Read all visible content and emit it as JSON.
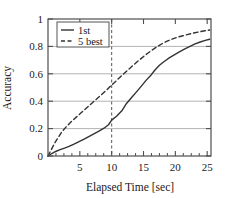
{
  "chart_data": {
    "type": "line",
    "title": "",
    "xlabel": "Elapsed Time [sec]",
    "ylabel": "Accuracy",
    "xlim": [
      0,
      25.6
    ],
    "ylim": [
      0,
      1
    ],
    "xticks": [
      5,
      10,
      15,
      20,
      25
    ],
    "xtick_labels": [
      "5",
      "10",
      "15",
      "20",
      "25"
    ],
    "yticks": [
      0,
      0.2,
      0.4,
      0.6,
      0.8,
      1
    ],
    "ytick_labels": [
      "0",
      "0.2",
      "0.4",
      "0.6",
      "0.8",
      "1"
    ],
    "x_minor_tick_step": 1.25,
    "grid": "horizontal",
    "grid_color": "#b3b3b3",
    "frame_color": "#4d4d4d",
    "legend_position": "top-left",
    "annotations": [
      {
        "name": "vertical-reference-line",
        "type": "vline",
        "x": 10,
        "style": "dashed",
        "color": "#555555"
      }
    ],
    "series": [
      {
        "name": "1st",
        "style": "solid",
        "color": "#333333",
        "x": [
          0,
          0.6,
          1.2,
          1.9,
          2.6,
          3.3,
          4.0,
          4.8,
          5.6,
          6.4,
          7.2,
          8.0,
          8.8,
          9.5,
          10.0,
          10.8,
          11.6,
          12.3,
          13.1,
          13.9,
          14.7,
          15.4,
          16.2,
          16.8,
          17.5,
          18.3,
          19.1,
          19.9,
          20.7,
          21.5,
          22.3,
          23.1,
          23.9,
          24.7,
          25.4
        ],
        "y": [
          0.0,
          0.018,
          0.033,
          0.046,
          0.058,
          0.07,
          0.085,
          0.103,
          0.122,
          0.142,
          0.162,
          0.182,
          0.203,
          0.228,
          0.262,
          0.292,
          0.33,
          0.382,
          0.425,
          0.468,
          0.512,
          0.552,
          0.592,
          0.628,
          0.662,
          0.692,
          0.718,
          0.74,
          0.762,
          0.782,
          0.8,
          0.818,
          0.832,
          0.844,
          0.852
        ]
      },
      {
        "name": "5 best",
        "style": "dashed",
        "color": "#333333",
        "x": [
          0,
          0.5,
          1.0,
          1.6,
          2.2,
          2.9,
          3.6,
          4.4,
          5.2,
          6.0,
          6.8,
          7.6,
          8.4,
          9.2,
          10.0,
          10.8,
          11.6,
          12.4,
          13.2,
          14.0,
          14.8,
          15.6,
          16.4,
          17.2,
          18.0,
          18.8,
          19.6,
          20.4,
          21.2,
          22.0,
          22.8,
          23.6,
          24.4,
          25.4
        ],
        "y": [
          0.0,
          0.045,
          0.09,
          0.135,
          0.178,
          0.215,
          0.248,
          0.282,
          0.315,
          0.348,
          0.382,
          0.415,
          0.448,
          0.482,
          0.518,
          0.552,
          0.588,
          0.622,
          0.655,
          0.688,
          0.718,
          0.748,
          0.775,
          0.8,
          0.822,
          0.84,
          0.855,
          0.868,
          0.878,
          0.888,
          0.897,
          0.905,
          0.912,
          0.92
        ]
      }
    ]
  }
}
